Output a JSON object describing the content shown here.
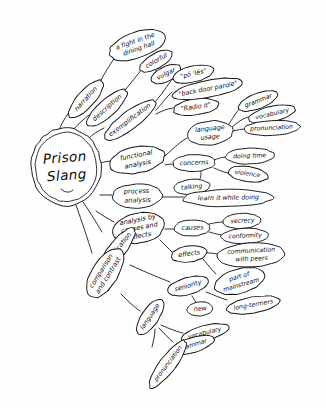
{
  "document": {
    "kind": "hand-drawn-mind-map",
    "title": "Prison Slang",
    "background_color": "#fefefe",
    "ink_color": "#141414",
    "canvas": {
      "width": 326,
      "height": 408
    }
  },
  "root": {
    "id": "root",
    "label": "Prison Slang",
    "lines": [
      "Prison",
      "Slang"
    ],
    "cx": 66,
    "cy": 167,
    "rx": 35,
    "ry": 39,
    "rotate": -4,
    "double_outline": true
  },
  "nodes": [
    {
      "id": "narration",
      "label": "narration",
      "lines": [
        "narration"
      ],
      "cx": 86,
      "cy": 99,
      "rx": 24,
      "ry": 8.5,
      "rotate": -48,
      "level": 1,
      "font": 6.6
    },
    {
      "id": "fight-dining-hall",
      "label": "a fight in the dining hall",
      "lines": [
        "a fight in the",
        "dining hall"
      ],
      "cx": 137,
      "cy": 45,
      "rx": 29,
      "ry": 13,
      "rotate": -19,
      "level": 2,
      "font": 6.1
    },
    {
      "id": "description",
      "label": "description",
      "lines": [
        "description"
      ],
      "cx": 107,
      "cy": 108,
      "rx": 26,
      "ry": 8.5,
      "rotate": -42,
      "level": 1,
      "font": 6.6
    },
    {
      "id": "colorful",
      "label": "colorful",
      "lines": [
        "colorful"
      ],
      "cx": 156,
      "cy": 61,
      "rx": 18,
      "ry": 7.5,
      "rotate": -30,
      "level": 2,
      "font": 6.1
    },
    {
      "id": "vulgar",
      "label": "vulgar",
      "lines": [
        "vulgar"
      ],
      "cx": 166,
      "cy": 74,
      "rx": 16,
      "ry": 7.5,
      "rotate": -26,
      "level": 2,
      "font": 6.1
    },
    {
      "id": "exemplification",
      "label": "exemplification",
      "lines": [
        "exemplification"
      ],
      "cx": 130,
      "cy": 120,
      "rx": 31,
      "ry": 9,
      "rotate": -37,
      "level": 1,
      "font": 6.6
    },
    {
      "id": "po-les",
      "label": "\"pō 'lēs\"",
      "lines": [
        "\"pō 'lēs\""
      ],
      "cx": 193,
      "cy": 74,
      "rx": 21,
      "ry": 8,
      "rotate": -13,
      "level": 2,
      "font": 6.2
    },
    {
      "id": "back-door-parole",
      "label": "\"back door parole\"",
      "lines": [
        "\"back door parole\""
      ],
      "cx": 208,
      "cy": 89,
      "rx": 36,
      "ry": 8.5,
      "rotate": -11,
      "level": 2,
      "font": 6.2
    },
    {
      "id": "radio-it",
      "label": "\"Radio it\"",
      "lines": [
        "\"Radio it\""
      ],
      "cx": 196,
      "cy": 107,
      "rx": 23,
      "ry": 8,
      "rotate": -8,
      "level": 2,
      "font": 6.2
    },
    {
      "id": "functional-analysis",
      "label": "functional analysis",
      "lines": [
        "functional",
        "analysis"
      ],
      "cx": 137,
      "cy": 160,
      "rx": 28,
      "ry": 13,
      "rotate": -11,
      "level": 1,
      "font": 6.8
    },
    {
      "id": "language-usage",
      "label": "language usage",
      "lines": [
        "language",
        "usage"
      ],
      "cx": 210,
      "cy": 133,
      "rx": 23,
      "ry": 12,
      "rotate": -6,
      "level": 2,
      "font": 6.4
    },
    {
      "id": "grammar-1",
      "label": "grammar",
      "lines": [
        "grammar"
      ],
      "cx": 258,
      "cy": 101,
      "rx": 21,
      "ry": 7.5,
      "rotate": -21,
      "level": 3,
      "font": 6.2
    },
    {
      "id": "vocabulary-1",
      "label": "vocabulary",
      "lines": [
        "vocabulary"
      ],
      "cx": 272,
      "cy": 114,
      "rx": 24,
      "ry": 7.5,
      "rotate": -13,
      "level": 3,
      "font": 6.2
    },
    {
      "id": "pronunciation-1",
      "label": "pronunciation",
      "lines": [
        "pronunciation"
      ],
      "cx": 272,
      "cy": 128,
      "rx": 28,
      "ry": 7.5,
      "rotate": -3,
      "level": 3,
      "font": 6.2
    },
    {
      "id": "concerns",
      "label": "concerns",
      "lines": [
        "concerns"
      ],
      "cx": 194,
      "cy": 163,
      "rx": 21,
      "ry": 8.5,
      "rotate": -2,
      "level": 2,
      "font": 6.5
    },
    {
      "id": "doing-time",
      "label": "doing time",
      "lines": [
        "doing time"
      ],
      "cx": 250,
      "cy": 156,
      "rx": 24,
      "ry": 8,
      "rotate": -2,
      "level": 3,
      "font": 6.3
    },
    {
      "id": "violence",
      "label": "violence",
      "lines": [
        "violence"
      ],
      "cx": 248,
      "cy": 174,
      "rx": 20,
      "ry": 7.5,
      "rotate": 8,
      "level": 3,
      "font": 6.3
    },
    {
      "id": "talking",
      "label": "talking",
      "lines": [
        "talking"
      ],
      "cx": 192,
      "cy": 187,
      "rx": 18,
      "ry": 7.5,
      "rotate": -5,
      "level": 3,
      "font": 6.3
    },
    {
      "id": "process-analysis",
      "label": "process analysis",
      "lines": [
        "process",
        "analysis"
      ],
      "cx": 137,
      "cy": 196,
      "rx": 25,
      "ry": 12,
      "rotate": -2,
      "level": 1,
      "font": 6.8
    },
    {
      "id": "learn-while-doing",
      "label": "learn it while doing",
      "lines": [
        "learn it while doing"
      ],
      "cx": 228,
      "cy": 198,
      "rx": 45,
      "ry": 8.5,
      "rotate": -1,
      "level": 2,
      "font": 6.5
    },
    {
      "id": "analysis-causes-effects",
      "label": "analysis by causes and effects",
      "lines": [
        "analysis by",
        "causes and",
        "effects"
      ],
      "cx": 139,
      "cy": 228,
      "rx": 26,
      "ry": 15,
      "rotate": -11,
      "level": 1,
      "font": 6.2
    },
    {
      "id": "causes",
      "label": "causes",
      "lines": [
        "causes"
      ],
      "cx": 192,
      "cy": 228,
      "rx": 18,
      "ry": 8,
      "rotate": -2,
      "level": 2,
      "font": 6.4
    },
    {
      "id": "secrecy",
      "label": "secrecy",
      "lines": [
        "secrecy"
      ],
      "cx": 242,
      "cy": 221,
      "rx": 19,
      "ry": 7.5,
      "rotate": -3,
      "level": 3,
      "font": 6.3
    },
    {
      "id": "conformity",
      "label": "conformity",
      "lines": [
        "conformity"
      ],
      "cx": 245,
      "cy": 236,
      "rx": 24,
      "ry": 7.5,
      "rotate": -2,
      "level": 3,
      "font": 6.3
    },
    {
      "id": "effects",
      "label": "effects",
      "lines": [
        "effects"
      ],
      "cx": 189,
      "cy": 254,
      "rx": 18,
      "ry": 8,
      "rotate": -8,
      "level": 2,
      "font": 6.4
    },
    {
      "id": "communication-peers",
      "label": "communication with peers",
      "lines": [
        "communication",
        "with peers"
      ],
      "cx": 251,
      "cy": 255,
      "rx": 34,
      "ry": 12,
      "rotate": -3,
      "level": 3,
      "font": 6.2
    },
    {
      "id": "part-of-mainstream",
      "label": "part of mainstream",
      "lines": [
        "part of",
        "mainstream"
      ],
      "cx": 240,
      "cy": 281,
      "rx": 26,
      "ry": 12,
      "rotate": -16,
      "level": 3,
      "font": 6.2
    },
    {
      "id": "classification",
      "label": "classification",
      "lines": [
        "classification"
      ],
      "cx": 117,
      "cy": 250,
      "rx": 27,
      "ry": 8.5,
      "rotate": -52,
      "level": 1,
      "font": 6.6
    },
    {
      "id": "seniority",
      "label": "seniority",
      "lines": [
        "seniority"
      ],
      "cx": 188,
      "cy": 286,
      "rx": 21,
      "ry": 8.5,
      "rotate": -16,
      "level": 2,
      "font": 6.4
    },
    {
      "id": "new",
      "label": "new",
      "lines": [
        "new"
      ],
      "cx": 200,
      "cy": 309,
      "rx": 13,
      "ry": 7,
      "rotate": -4,
      "level": 3,
      "font": 6.3
    },
    {
      "id": "long-termers",
      "label": "long-termers",
      "lines": [
        "long-termers"
      ],
      "cx": 253,
      "cy": 305,
      "rx": 27,
      "ry": 8,
      "rotate": -10,
      "level": 3,
      "font": 6.3
    },
    {
      "id": "comparison-contrast",
      "label": "comparison and contrast",
      "lines": [
        "comparison",
        "and contrast"
      ],
      "cx": 105,
      "cy": 273,
      "rx": 28,
      "ry": 13,
      "rotate": -58,
      "level": 1,
      "font": 6.3
    },
    {
      "id": "language-2",
      "label": "language",
      "lines": [
        "language"
      ],
      "cx": 150,
      "cy": 317,
      "rx": 21,
      "ry": 8.5,
      "rotate": -56,
      "level": 2,
      "font": 6.4
    },
    {
      "id": "vocabulary-2",
      "label": "vocabulary",
      "lines": [
        "vocabulary"
      ],
      "cx": 205,
      "cy": 333,
      "rx": 24,
      "ry": 7.5,
      "rotate": -14,
      "level": 3,
      "font": 6.3
    },
    {
      "id": "grammar-2",
      "label": "grammar",
      "lines": [
        "grammar"
      ],
      "cx": 193,
      "cy": 345,
      "rx": 22,
      "ry": 7.5,
      "rotate": -17,
      "level": 3,
      "font": 6.3
    },
    {
      "id": "pronunciation-2",
      "label": "pronunciation",
      "lines": [
        "pronunciation"
      ],
      "cx": 168,
      "cy": 364,
      "rx": 29,
      "ry": 8,
      "rotate": -53,
      "level": 3,
      "font": 6.3
    }
  ],
  "edges": [
    {
      "from": "root",
      "to": "narration",
      "path": "M 59 130 C 62 122 68 113 73 107"
    },
    {
      "from": "narration",
      "to": "fight-dining-hall",
      "path": "M 99 84 C 104 74 110 64 116 56"
    },
    {
      "from": "root",
      "to": "description",
      "path": "M 73 130 C 78 124 84 119 89 115"
    },
    {
      "from": "description",
      "to": "colorful",
      "path": "M 122 94 C 130 84 138 74 143 68"
    },
    {
      "from": "colorful",
      "to": "vulgar",
      "path": "M 155 69 C 156 71 157 73 158 75"
    },
    {
      "from": "root",
      "to": "exemplification",
      "path": "M 88 139 C 93 134 98 131 104 128"
    },
    {
      "from": "exemplification",
      "to": "po-les",
      "path": "M 152 105 C 161 96 167 86 173 78"
    },
    {
      "from": "exemplification",
      "to": "back-door-parole",
      "path": "M 156 110 C 162 104 166 97 172 92"
    },
    {
      "from": "exemplification",
      "to": "radio-it",
      "path": "M 156 114 C 162 111 166 109 173 108"
    },
    {
      "from": "root",
      "to": "functional-analysis",
      "path": "M 100 163 C 104 162 108 161 112 161"
    },
    {
      "from": "functional-analysis",
      "to": "language-usage",
      "path": "M 165 156 C 172 150 178 143 187 138"
    },
    {
      "from": "language-usage",
      "to": "grammar-1",
      "path": "M 229 124 C 234 116 238 110 241 107"
    },
    {
      "from": "language-usage",
      "to": "vocabulary-1",
      "path": "M 232 127 C 238 122 242 119 248 117"
    },
    {
      "from": "language-usage",
      "to": "pronunciation-1",
      "path": "M 233 131 C 238 130 241 129 245 129"
    },
    {
      "from": "functional-analysis",
      "to": "concerns",
      "path": "M 165 165 C 169 164 172 164 174 164"
    },
    {
      "from": "concerns",
      "to": "doing-time",
      "path": "M 214 160 C 219 158 223 157 227 157"
    },
    {
      "from": "concerns",
      "to": "violence",
      "path": "M 214 168 C 219 170 223 172 228 173"
    },
    {
      "from": "concerns",
      "to": "talking",
      "path": "M 201 171 C 201 176 201 180 198 180"
    },
    {
      "from": "root",
      "to": "process-analysis",
      "path": "M 100 195 C 104 195 108 195 112 195"
    },
    {
      "from": "process-analysis",
      "to": "learn-while-doing",
      "path": "M 162 197 C 168 197 174 197 184 197"
    },
    {
      "from": "root",
      "to": "analysis-causes-effects",
      "path": "M 96 211 C 102 215 108 219 114 222"
    },
    {
      "from": "analysis-causes-effects",
      "to": "causes",
      "path": "M 165 229 C 169 229 171 229 175 229"
    },
    {
      "from": "causes",
      "to": "secrecy",
      "path": "M 209 224 C 214 223 218 222 223 222"
    },
    {
      "from": "causes",
      "to": "conformity",
      "path": "M 209 232 C 213 233 216 234 221 235"
    },
    {
      "from": "analysis-causes-effects",
      "to": "effects",
      "path": "M 160 240 C 165 245 169 249 172 252"
    },
    {
      "from": "effects",
      "to": "communication-peers",
      "path": "M 206 253 C 210 253 213 253 217 254"
    },
    {
      "from": "effects",
      "to": "part-of-mainstream",
      "path": "M 203 259 C 208 265 212 270 216 274"
    },
    {
      "from": "root",
      "to": "classification",
      "path": "M 83 202 C 90 212 96 222 102 232"
    },
    {
      "from": "classification",
      "to": "seniority",
      "path": "M 130 265 C 145 272 160 278 170 282"
    },
    {
      "from": "seniority",
      "to": "new",
      "path": "M 192 296 C 195 301 197 305 199 303"
    },
    {
      "from": "seniority",
      "to": "long-termers",
      "path": "M 206 292 C 214 295 220 298 227 300"
    },
    {
      "from": "root",
      "to": "comparison-contrast",
      "path": "M 76 205 C 82 222 88 240 92 253"
    },
    {
      "from": "comparison-contrast",
      "to": "language-2",
      "path": "M 121 294 C 128 301 134 307 140 311"
    },
    {
      "from": "language-2",
      "to": "vocabulary-2",
      "path": "M 161 325 C 170 329 178 332 183 333"
    },
    {
      "from": "language-2",
      "to": "grammar-2",
      "path": "M 159 328 C 165 334 169 339 173 342"
    },
    {
      "from": "language-2",
      "to": "pronunciation-2",
      "path": "M 155 329 C 155 336 153 342 152 347"
    }
  ]
}
